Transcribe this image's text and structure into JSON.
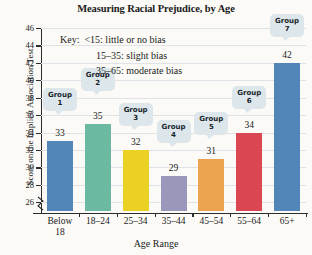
{
  "chart_data": {
    "type": "bar",
    "title": "Measuring Racial Prejudice, by Age",
    "xlabel": "Age Range",
    "ylabel": "Score on the Implicit Association Test",
    "categories": [
      "Below 18",
      "18–24",
      "25–34",
      "35–44",
      "45–54",
      "55–64",
      "65+"
    ],
    "category_lines": [
      [
        "Below",
        "18"
      ],
      [
        "18–24",
        ""
      ],
      [
        "25–34",
        ""
      ],
      [
        "35–44",
        ""
      ],
      [
        "45–54",
        ""
      ],
      [
        "55–64",
        ""
      ],
      [
        "65+",
        ""
      ]
    ],
    "values": [
      33,
      35,
      32,
      29,
      31,
      34,
      42
    ],
    "point_labels": [
      "Group 1",
      "Group 2",
      "Group 3",
      "Group 4",
      "Group 5",
      "Group 6",
      "Group 7"
    ],
    "group_numbers": [
      "1",
      "2",
      "3",
      "4",
      "5",
      "6",
      "7"
    ],
    "group_word": "Group",
    "bar_colors": [
      "#5286b9",
      "#6cb9a2",
      "#ead124",
      "#9a98ba",
      "#eaa351",
      "#da4753",
      "#5286b9"
    ],
    "ylim": [
      25,
      46
    ],
    "yticks": [
      26,
      28,
      30,
      32,
      34,
      36,
      38,
      40,
      42,
      44,
      46
    ],
    "grid": true,
    "axis_break": true,
    "legend_position": "inside-top"
  },
  "key": {
    "title": "Key:",
    "entries": [
      "<15: little or no bias",
      "15–35: slight bias",
      "35–65: moderate bias"
    ]
  }
}
